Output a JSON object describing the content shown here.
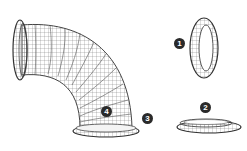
{
  "diagram": {
    "type": "exploded-parts-illustration",
    "colors": {
      "background": "#ffffff",
      "wireframe": "#555555",
      "callout_fill": "#2a2a2a",
      "callout_text": "#ffffff"
    },
    "callouts": [
      {
        "label": "1",
        "part": "upright ring",
        "x": 179,
        "y": 43
      },
      {
        "label": "2",
        "part": "flat flange ring",
        "x": 205,
        "y": 107
      },
      {
        "label": "3",
        "part": "elbow bottom flange",
        "x": 147,
        "y": 118
      },
      {
        "label": "4",
        "part": "elbow body",
        "x": 106,
        "y": 111
      }
    ]
  }
}
